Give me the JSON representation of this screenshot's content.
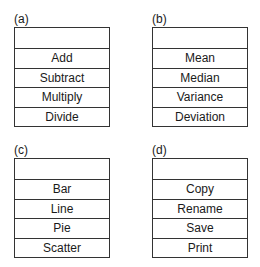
{
  "panels": [
    {
      "label": "(a)",
      "items": [
        "Add",
        "Subtract",
        "Multiply",
        "Divide"
      ]
    },
    {
      "label": "(b)",
      "items": [
        "Mean",
        "Median",
        "Variance",
        "Deviation"
      ]
    },
    {
      "label": "(c)",
      "items": [
        "Bar",
        "Line",
        "Pie",
        "Scatter"
      ]
    },
    {
      "label": "(d)",
      "items": [
        "Copy",
        "Rename",
        "Save",
        "Print"
      ]
    }
  ]
}
